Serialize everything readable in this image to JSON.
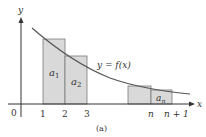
{
  "figure": {
    "caption": "(a)",
    "curve_label": "y = f(x)",
    "axes": {
      "x_label": "x",
      "y_label": "y",
      "origin_label": "0",
      "x_ticks": [
        "1",
        "2",
        "3",
        "n",
        "n + 1"
      ]
    },
    "rectangles": [
      {
        "label": "a",
        "sub": "1",
        "from": "1",
        "to": "2"
      },
      {
        "label": "a",
        "sub": "2",
        "from": "2",
        "to": "3"
      },
      {
        "label": "",
        "sub": "",
        "from": "n-1",
        "to": "n"
      },
      {
        "label": "a",
        "sub": "n",
        "from": "n",
        "to": "n + 1"
      }
    ],
    "colors": {
      "rect_fill": "#d9d9d9",
      "rect_stroke": "#7a7a7a",
      "axis": "#333333",
      "curve": "#555555"
    }
  }
}
